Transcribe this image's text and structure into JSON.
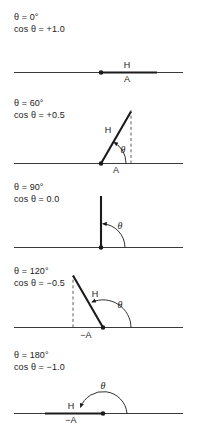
{
  "figure": {
    "background_color": "#ffffff",
    "ink_color": "#1b1b1b",
    "width": 197,
    "height": 438
  },
  "panels": [
    {
      "id": "panel-0deg",
      "angle_label": "θ = 0°",
      "cos_label": "cos θ = +1.0",
      "angle_deg": 0,
      "cos_value": "+1.0",
      "hypotenuse_label": "H",
      "adjacent_label": "A",
      "theta_label": "θ",
      "has_dashed_drop": false,
      "has_theta_arc": false
    },
    {
      "id": "panel-60deg",
      "angle_label": "θ = 60°",
      "cos_label": "cos θ = +0.5",
      "angle_deg": 60,
      "cos_value": "+0.5",
      "hypotenuse_label": "H",
      "adjacent_label": "A",
      "theta_label": "θ",
      "has_dashed_drop": true,
      "has_theta_arc": true
    },
    {
      "id": "panel-90deg",
      "angle_label": "θ = 90°",
      "cos_label": "cos θ = 0.0",
      "angle_deg": 90,
      "cos_value": "0.0",
      "hypotenuse_label": "",
      "adjacent_label": "",
      "theta_label": "θ",
      "has_dashed_drop": false,
      "has_theta_arc": true
    },
    {
      "id": "panel-120deg",
      "angle_label": "θ = 120°",
      "cos_label": "cos θ = −0.5",
      "angle_deg": 120,
      "cos_value": "−0.5",
      "hypotenuse_label": "H",
      "adjacent_label": "−A",
      "theta_label": "θ",
      "has_dashed_drop": true,
      "has_theta_arc": true
    },
    {
      "id": "panel-180deg",
      "angle_label": "θ = 180°",
      "cos_label": "cos θ = −1.0",
      "angle_deg": 180,
      "cos_value": "−1.0",
      "hypotenuse_label": "H",
      "adjacent_label": "−A",
      "theta_label": "θ",
      "has_dashed_drop": false,
      "has_theta_arc": true
    }
  ]
}
